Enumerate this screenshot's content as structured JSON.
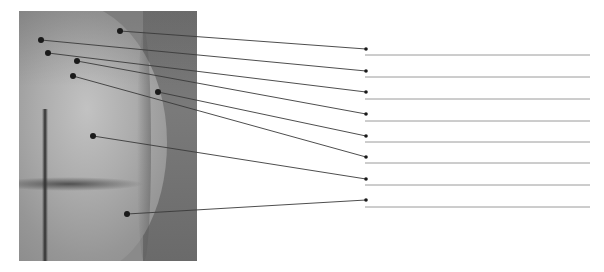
{
  "figure": {
    "type": "labeling-exercise",
    "photo": {
      "description": "grayscale photograph, posterior view",
      "x": 19,
      "y": 11,
      "width": 178,
      "height": 250
    },
    "colors": {
      "leader_line": "#3a3a3a",
      "marker": "#1a1a1a",
      "answer_line": "#9a9a9a",
      "background": "#ffffff"
    },
    "answer_line": {
      "x_start": 365,
      "x_end": 590
    },
    "labels": [
      {
        "id": 1,
        "point": [
          120,
          31
        ],
        "target": [
          366,
          49
        ],
        "answer_y": 55,
        "text": ""
      },
      {
        "id": 2,
        "point": [
          41,
          40
        ],
        "target": [
          366,
          71
        ],
        "answer_y": 77,
        "text": ""
      },
      {
        "id": 3,
        "point": [
          48,
          53
        ],
        "target": [
          366,
          92
        ],
        "answer_y": 99,
        "text": ""
      },
      {
        "id": 4,
        "point": [
          77,
          61
        ],
        "target": [
          366,
          114
        ],
        "answer_y": 121,
        "text": ""
      },
      {
        "id": 5,
        "point": [
          158,
          92
        ],
        "target": [
          366,
          136
        ],
        "answer_y": 142,
        "text": ""
      },
      {
        "id": 6,
        "point": [
          73,
          76
        ],
        "target": [
          366,
          157
        ],
        "answer_y": 163,
        "text": ""
      },
      {
        "id": 7,
        "point": [
          93,
          136
        ],
        "target": [
          366,
          179
        ],
        "answer_y": 185,
        "text": ""
      },
      {
        "id": 8,
        "point": [
          127,
          214
        ],
        "target": [
          366,
          200
        ],
        "answer_y": 207,
        "text": ""
      }
    ]
  }
}
